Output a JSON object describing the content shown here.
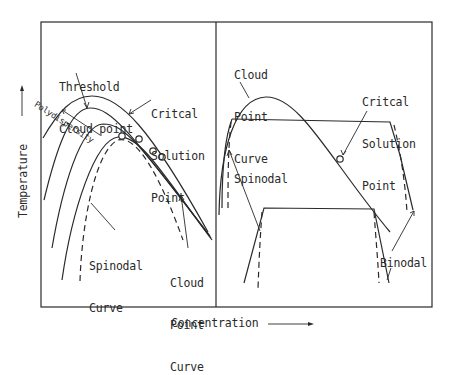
{
  "figure": {
    "x_axis_label": "Concentration",
    "y_axis_label": "Temperature",
    "x_axis_arrow": "right-arrow",
    "y_axis_arrow": "up-arrow",
    "line_color": "#2a2a2a"
  },
  "left_panel": {
    "labels": {
      "threshold_line1": "Threshold",
      "threshold_line2": "Cloud point",
      "critical_line1": "Critcal",
      "critical_line2": "Solution",
      "critical_line3": "Point",
      "polydispersity": "Polydispersity",
      "spinodal_line1": "Spinodal",
      "spinodal_line2": "Curve",
      "cloud_line1": "Cloud",
      "cloud_line2": "Point",
      "cloud_line3": "Curve"
    },
    "curves": [
      {
        "name": "cloud-point-curve-1",
        "style": "solid"
      },
      {
        "name": "cloud-point-curve-2",
        "style": "solid"
      },
      {
        "name": "cloud-point-curve-3",
        "style": "solid"
      },
      {
        "name": "cloud-point-curve-4",
        "style": "solid"
      },
      {
        "name": "spinodal-curve",
        "style": "dashed"
      }
    ],
    "critical_points": 4
  },
  "right_panel": {
    "labels": {
      "cloud_line1": "Cloud",
      "cloud_line2": "Point",
      "cloud_line3": "Curve",
      "critical_line1": "Critcal",
      "critical_line2": "Solution",
      "critical_line3": "Point",
      "spinodal": "Spinodal",
      "binodal": "Binodal"
    },
    "tie_lines": 2,
    "critical_points": 1
  }
}
